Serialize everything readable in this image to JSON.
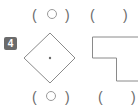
{
  "question": {
    "number": "4",
    "badge_color": "#6b6b6b"
  },
  "top_row": {
    "answers": [
      {
        "open": "(",
        "mark": "circle",
        "close": ")"
      },
      {
        "open": "(",
        "mark": "",
        "close": ")"
      }
    ]
  },
  "figures": [
    {
      "shape": "diamond",
      "label": "square rotated 45 degrees with center dot"
    },
    {
      "shape": "l-shape",
      "label": "L-shaped polygon"
    }
  ],
  "bottom_row": {
    "answers": [
      {
        "open": "(",
        "mark": "circle",
        "close": ")"
      },
      {
        "open": "(",
        "mark": "",
        "close": ")"
      }
    ]
  },
  "colors": {
    "outline": "#8a8a8a",
    "text": "#6a6a6a"
  }
}
